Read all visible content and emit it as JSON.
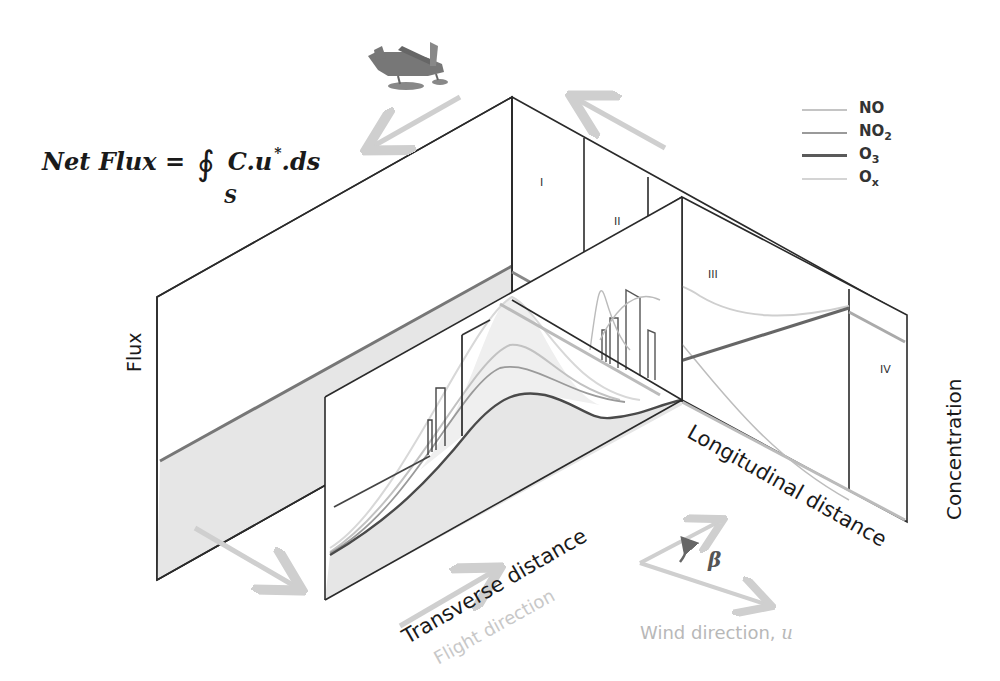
{
  "formula": {
    "lhs": "Net Flux =",
    "integral_symbol": "∮",
    "integrand": "C.u",
    "superscript": "*",
    "tail": ".ds",
    "subscript": "S"
  },
  "legend": {
    "items": [
      {
        "label": "NO",
        "sub": "",
        "color": "#c4c4c4"
      },
      {
        "label": "NO",
        "sub": "2",
        "color": "#9a9a9a"
      },
      {
        "label": "O",
        "sub": "3",
        "color": "#5a5a5a"
      },
      {
        "label": "O",
        "sub": "x",
        "color": "#d4d4d4"
      }
    ]
  },
  "axes": {
    "flux": "Flux",
    "concentration": "Concentration",
    "transverse": "Transverse distance",
    "longitudinal": "Longitudinal distance",
    "flight_direction": "Flight direction",
    "wind_direction": "Wind direction,",
    "wind_symbol": "u",
    "angle": "β"
  },
  "regions": [
    "I",
    "II",
    "III",
    "IV"
  ],
  "colors": {
    "frame": "#2a2a2a",
    "shade": "#e6e6e6",
    "arrow": "#cfcfcf",
    "no": "#c4c4c4",
    "no2": "#9a9a9a",
    "o3": "#5a5a5a",
    "ox": "#d4d4d4"
  }
}
